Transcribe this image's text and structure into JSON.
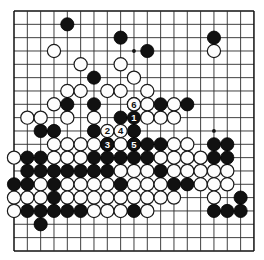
{
  "app": {
    "title": "Go board diagram",
    "kind": "go-game-diagram"
  },
  "board": {
    "size": 19,
    "origin_x": 14,
    "origin_y": 11,
    "spacing": 13.33,
    "stone_radius": 6.6,
    "line_color": "#2b2b2b",
    "edge_color": "#111111",
    "background_color": "#ffffff",
    "black_color": "#111111",
    "white_color": "#fdfdfd",
    "hoshi_points": [
      [
        3,
        3
      ],
      [
        9,
        3
      ],
      [
        15,
        3
      ],
      [
        3,
        9
      ],
      [
        9,
        9
      ],
      [
        15,
        9
      ],
      [
        3,
        15
      ],
      [
        9,
        15
      ],
      [
        15,
        15
      ]
    ]
  },
  "stones": {
    "black": [
      [
        4,
        1
      ],
      [
        8,
        2
      ],
      [
        10,
        3
      ],
      [
        15,
        2
      ],
      [
        6,
        5
      ],
      [
        4,
        7
      ],
      [
        6,
        7
      ],
      [
        11,
        7
      ],
      [
        13,
        7
      ],
      [
        8,
        8
      ],
      [
        9,
        9
      ],
      [
        6,
        9
      ],
      [
        2,
        9
      ],
      [
        3,
        9
      ],
      [
        9,
        10
      ],
      [
        10,
        10
      ],
      [
        11,
        10
      ],
      [
        15,
        10
      ],
      [
        16,
        10
      ],
      [
        8,
        11
      ],
      [
        9,
        11
      ],
      [
        10,
        11
      ],
      [
        15,
        11
      ],
      [
        16,
        11
      ],
      [
        1,
        11
      ],
      [
        2,
        11
      ],
      [
        6,
        11
      ],
      [
        7,
        11
      ],
      [
        1,
        12
      ],
      [
        2,
        12
      ],
      [
        3,
        12
      ],
      [
        4,
        12
      ],
      [
        5,
        12
      ],
      [
        6,
        12
      ],
      [
        7,
        12
      ],
      [
        0,
        13
      ],
      [
        1,
        13
      ],
      [
        3,
        13
      ],
      [
        8,
        13
      ],
      [
        12,
        13
      ],
      [
        13,
        13
      ],
      [
        3,
        14
      ],
      [
        17,
        14
      ],
      [
        1,
        15
      ],
      [
        2,
        15
      ],
      [
        3,
        15
      ],
      [
        4,
        15
      ],
      [
        5,
        15
      ],
      [
        9,
        15
      ],
      [
        15,
        15
      ],
      [
        16,
        15
      ],
      [
        17,
        15
      ],
      [
        2,
        16
      ],
      [
        11,
        12
      ]
    ],
    "white": [
      [
        3,
        3
      ],
      [
        15,
        3
      ],
      [
        5,
        4
      ],
      [
        8,
        4
      ],
      [
        9,
        5
      ],
      [
        4,
        6
      ],
      [
        5,
        6
      ],
      [
        7,
        6
      ],
      [
        8,
        6
      ],
      [
        10,
        6
      ],
      [
        3,
        7
      ],
      [
        9,
        7
      ],
      [
        10,
        7
      ],
      [
        12,
        7
      ],
      [
        4,
        8
      ],
      [
        6,
        8
      ],
      [
        10,
        8
      ],
      [
        11,
        8
      ],
      [
        12,
        8
      ],
      [
        1,
        8
      ],
      [
        2,
        8
      ],
      [
        3,
        10
      ],
      [
        4,
        10
      ],
      [
        5,
        10
      ],
      [
        6,
        10
      ],
      [
        7,
        10
      ],
      [
        8,
        10
      ],
      [
        12,
        10
      ],
      [
        13,
        10
      ],
      [
        3,
        11
      ],
      [
        4,
        11
      ],
      [
        5,
        11
      ],
      [
        11,
        11
      ],
      [
        12,
        11
      ],
      [
        13,
        11
      ],
      [
        14,
        11
      ],
      [
        0,
        11
      ],
      [
        8,
        12
      ],
      [
        9,
        12
      ],
      [
        10,
        12
      ],
      [
        12,
        12
      ],
      [
        13,
        12
      ],
      [
        14,
        12
      ],
      [
        15,
        12
      ],
      [
        16,
        12
      ],
      [
        2,
        13
      ],
      [
        4,
        13
      ],
      [
        5,
        13
      ],
      [
        6,
        13
      ],
      [
        7,
        13
      ],
      [
        9,
        13
      ],
      [
        10,
        13
      ],
      [
        11,
        13
      ],
      [
        14,
        13
      ],
      [
        15,
        13
      ],
      [
        16,
        13
      ],
      [
        0,
        14
      ],
      [
        1,
        14
      ],
      [
        2,
        14
      ],
      [
        4,
        14
      ],
      [
        5,
        14
      ],
      [
        6,
        14
      ],
      [
        7,
        14
      ],
      [
        8,
        14
      ],
      [
        9,
        14
      ],
      [
        10,
        14
      ],
      [
        11,
        14
      ],
      [
        12,
        14
      ],
      [
        0,
        15
      ],
      [
        6,
        15
      ],
      [
        7,
        15
      ],
      [
        8,
        15
      ],
      [
        10,
        15
      ],
      [
        15,
        14
      ]
    ]
  },
  "move_markers": [
    {
      "label": "1",
      "x": 9,
      "y": 8,
      "color": "black"
    },
    {
      "label": "2",
      "x": 7,
      "y": 9,
      "color": "white"
    },
    {
      "label": "3",
      "x": 7,
      "y": 10,
      "color": "black"
    },
    {
      "label": "4",
      "x": 8,
      "y": 9,
      "color": "white"
    },
    {
      "label": "5",
      "x": 9,
      "y": 10,
      "color": "black"
    },
    {
      "label": "6",
      "x": 9,
      "y": 7,
      "color": "white"
    }
  ]
}
